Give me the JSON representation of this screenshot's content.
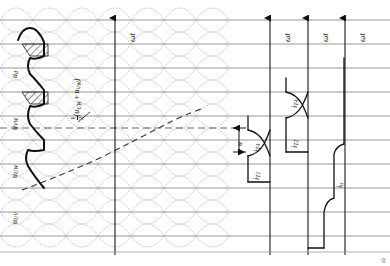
{
  "figure": {
    "domain": "Diagram",
    "kind": "waveform-timing-diagram",
    "caption": "a)",
    "background": "#ffffff",
    "ink_color": "#111111",
    "grid_color": "#8a8a8a",
    "dotted_color": "#b9b9b9",
    "width": 390,
    "height": 266
  },
  "axes": [
    {
      "id": "axis-1",
      "label": "ωt",
      "x": 115,
      "arrow_top": 16,
      "arrow_bottom": 255
    },
    {
      "id": "axis-2",
      "label": "ωt",
      "x": 270,
      "arrow_top": 16,
      "arrow_bottom": 255
    },
    {
      "id": "axis-3",
      "label": "ωt",
      "x": 308,
      "arrow_top": 16,
      "arrow_bottom": 255
    },
    {
      "id": "axis-4",
      "label": "ωt",
      "x": 345,
      "arrow_top": 16,
      "arrow_bottom": 255
    }
  ],
  "gridlines": {
    "horizontal": [
      20,
      44,
      68,
      92,
      116,
      140,
      164,
      188,
      212,
      236
    ],
    "dashed_center": 128,
    "vertical": [
      115,
      270,
      308,
      345
    ]
  },
  "signal_labels": [
    {
      "id": "u-d",
      "base": "u",
      "sub": "d",
      "x": 13,
      "y": 78,
      "desc": "rectified dc output voltage"
    },
    {
      "id": "u-vw",
      "base": "u",
      "sub": "VW",
      "x": 13,
      "y": 125,
      "desc": "line voltage V-W"
    },
    {
      "id": "u-uw",
      "base": "u",
      "sub": "UW",
      "x": 13,
      "y": 170,
      "desc": "line voltage U-W"
    },
    {
      "id": "u-uv",
      "base": "u",
      "sub": "UV",
      "x": 13,
      "y": 214,
      "desc": "line voltage U-V"
    }
  ],
  "mean_label": {
    "id": "half-sum",
    "fraction_num": "1",
    "fraction_den": "2",
    "expr_open": "(",
    "term_a_base": "u",
    "term_a_sub": "UW",
    "plus": "+",
    "term_b_base": "u",
    "term_b_sub": "VW",
    "expr_close": ")",
    "x": 65,
    "y": 118,
    "leader": {
      "x1": 74,
      "y1": 120,
      "x2": 86,
      "y2": 110
    }
  },
  "current_labels": [
    {
      "id": "i-t4-left",
      "base": "i",
      "sub": "T4",
      "x": 250,
      "y": 152
    },
    {
      "id": "i-t1",
      "base": "i",
      "sub": "T1",
      "x": 250,
      "y": 175
    },
    {
      "id": "i-t4-upper",
      "base": "i",
      "sub": "T4",
      "x": 288,
      "y": 105
    },
    {
      "id": "i-t2",
      "base": "i",
      "sub": "T2",
      "x": 288,
      "y": 140
    },
    {
      "id": "i-u",
      "base": "i",
      "sub": "u",
      "x": 333,
      "y": 178
    }
  ],
  "dimension_arrow": {
    "id": "u-overlap",
    "label": "u",
    "x": 243,
    "y_top": 128,
    "y_bottom": 152,
    "desc": "commutation overlap angle marker"
  },
  "hatched_regions": [
    {
      "id": "hatch-1",
      "x": 22,
      "y": 42,
      "w": 26,
      "h": 14,
      "angle": 45
    },
    {
      "id": "hatch-2",
      "x": 22,
      "y": 84,
      "w": 26,
      "h": 14,
      "angle": 45
    }
  ],
  "dotted_envelopes": {
    "count": 6,
    "desc": "three-phase line-voltage sine envelopes, dotted, 120 deg apart, repeated over the plot width",
    "amplitude": 22,
    "period": 130
  },
  "heavy_trace": {
    "id": "ud-trace",
    "desc": "thick stepped rectified voltage waveform on the left with commutation notches"
  }
}
